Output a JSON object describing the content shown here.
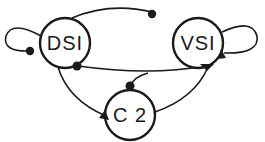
{
  "diagram": {
    "type": "circuit-connectivity",
    "nodes": [
      {
        "id": "DSI",
        "label": "DSI",
        "cx": 65,
        "cy": 43,
        "r": 25
      },
      {
        "id": "VSI",
        "label": "VSI",
        "cx": 198,
        "cy": 43,
        "r": 25
      },
      {
        "id": "C2",
        "label": "C 2",
        "cx": 130,
        "cy": 115,
        "r": 25
      }
    ],
    "edges": [
      {
        "from": "DSI",
        "to": "VSI",
        "terminal": "dot",
        "route": "top-arc"
      },
      {
        "from": "VSI",
        "to": "DSI",
        "terminal": "dot",
        "route": "middle"
      },
      {
        "from": "VSI",
        "to": "C2",
        "terminal": "dot",
        "route": "branch-from-middle"
      },
      {
        "from": "DSI",
        "to": "C2",
        "terminal": "triangle",
        "route": "left-arc"
      },
      {
        "from": "C2",
        "to": "VSI",
        "terminal": "triangle",
        "route": "right-arc"
      },
      {
        "from": "DSI",
        "to": "DSI",
        "terminal": "dot",
        "route": "self-loop-left"
      },
      {
        "from": "VSI",
        "to": "VSI",
        "terminal": "triangle",
        "route": "self-loop-right"
      }
    ],
    "legend": {
      "dot": "inhibitory synapse",
      "triangle": "excitatory synapse"
    }
  }
}
